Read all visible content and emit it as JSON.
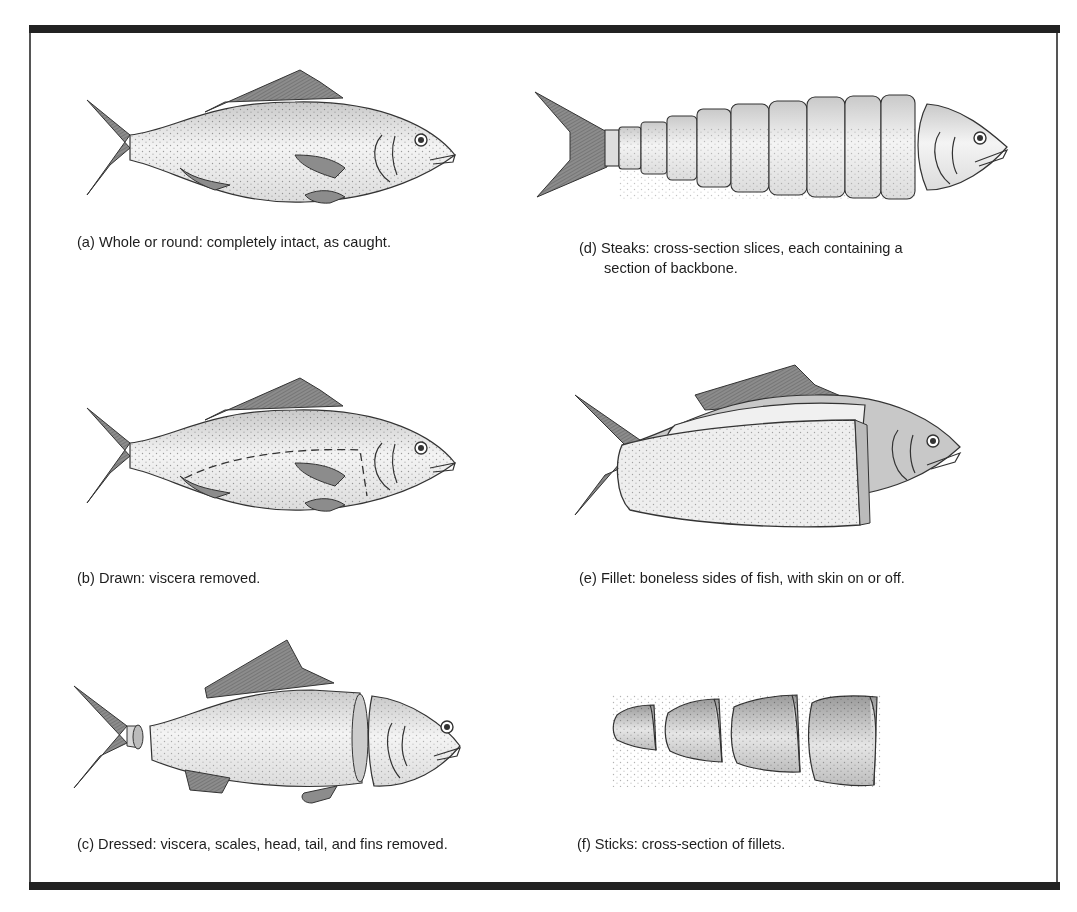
{
  "figure": {
    "panels": [
      {
        "id": "a",
        "label": "(a)",
        "text": "Whole or round: completely intact, as caught."
      },
      {
        "id": "b",
        "label": "(b)",
        "text": "Drawn: viscera removed."
      },
      {
        "id": "c",
        "label": "(c)",
        "text": "Dressed: viscera, scales, head, tail, and fins removed."
      },
      {
        "id": "d",
        "label": "(d)",
        "text": "Steaks: cross-section slices, each containing a",
        "text_line2": "section of backbone."
      },
      {
        "id": "e",
        "label": "(e)",
        "text": "Fillet: boneless sides of fish, with skin on or off."
      },
      {
        "id": "f",
        "label": "(f)",
        "text": "Sticks: cross-section of fillets."
      }
    ]
  },
  "colors": {
    "frame_bar": "#222222",
    "frame_side": "#555555",
    "fin": "#8a8a8a",
    "body_light": "#f2f2f2",
    "body_mid": "#d0d0d0",
    "outline": "#333333"
  }
}
